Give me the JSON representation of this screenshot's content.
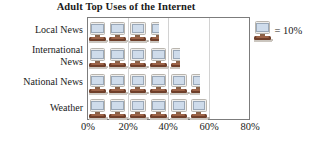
{
  "chart_data": {
    "type": "bar",
    "title": "Adult Top Uses of the Internet",
    "subtitle": "",
    "xlabel": "",
    "ylabel": "",
    "categories": [
      "Local News",
      "International News",
      "National News",
      "Weather"
    ],
    "values": [
      35,
      45,
      55,
      60
    ],
    "value_unit": "%",
    "xlim": [
      0,
      80
    ],
    "ylim": [
      0,
      4
    ],
    "xticks": [
      0,
      20,
      40,
      60,
      80
    ],
    "xticklabels": [
      "0%",
      "20%",
      "40%",
      "60%",
      "80%"
    ],
    "grid": true,
    "grid_axis": "x",
    "legend_position": "right-outside",
    "legend": [
      {
        "icon": "computer-monitor-icon",
        "label": "= 10%",
        "unit_value": 10
      }
    ],
    "pictograph": {
      "icon": "computer-monitor-icon",
      "icon_value": 10,
      "rows": [
        {
          "category": "Local News",
          "full_icons": 3,
          "partial_icon": 0.5,
          "value": 35
        },
        {
          "category": "International News",
          "full_icons": 4,
          "partial_icon": 0.5,
          "value": 45
        },
        {
          "category": "National News",
          "full_icons": 5,
          "partial_icon": 0.5,
          "value": 55
        },
        {
          "category": "Weather",
          "full_icons": 6,
          "partial_icon": 0,
          "value": 60
        }
      ]
    },
    "colors": {
      "screen": "#cfdceb",
      "case": "#efeeec",
      "base": "#6f3f2a",
      "frame": "#7c7c7c",
      "gridline": "#d2d2d2",
      "text": "#1a1a1a",
      "background": "#ffffff"
    }
  },
  "title": {
    "text": "Adult Top Uses of the Internet"
  },
  "axis": {
    "x_ticklabels": [
      "0%",
      "20%",
      "40%",
      "60%",
      "80%"
    ],
    "y_categories": [
      "Local News",
      "International News\nNews",
      "National News",
      "Weather"
    ]
  },
  "y_labels": [
    "Local News",
    "International\nNews",
    "National News",
    "Weather"
  ],
  "legend": {
    "text": "= 10%",
    "icon_name": "computer-monitor-icon"
  }
}
